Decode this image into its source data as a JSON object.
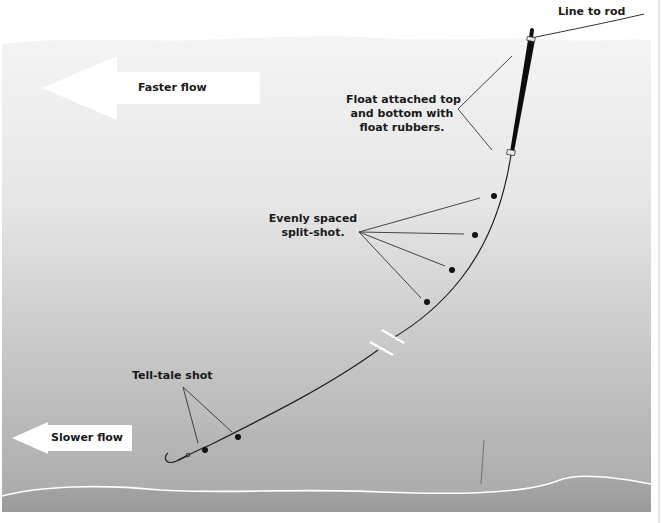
{
  "diagram": {
    "labels": {
      "line_to_rod": "Line to rod",
      "faster_flow": "Faster flow",
      "slower_flow": "Slower flow",
      "float_attached": [
        "Float attached top",
        "and bottom with",
        "float rubbers."
      ],
      "evenly_spaced": [
        "Evenly spaced",
        "split-shot."
      ],
      "tell_tale": "Tell-tale shot"
    },
    "colors": {
      "water_top": "#f2f2f2",
      "water_bottom": "#a6a6a6",
      "riverbed": "#9e9e9e",
      "line": "#222222",
      "float": "#0d0d0d",
      "arrow": "#ffffff",
      "surface_line": "#ffffff"
    },
    "elements": {
      "float": "black stick float attached with two float rubbers",
      "split_shot_count": 4,
      "tell_tale_shot_count": 2,
      "hook": "hook-icon",
      "line_break": "break-marker"
    }
  }
}
